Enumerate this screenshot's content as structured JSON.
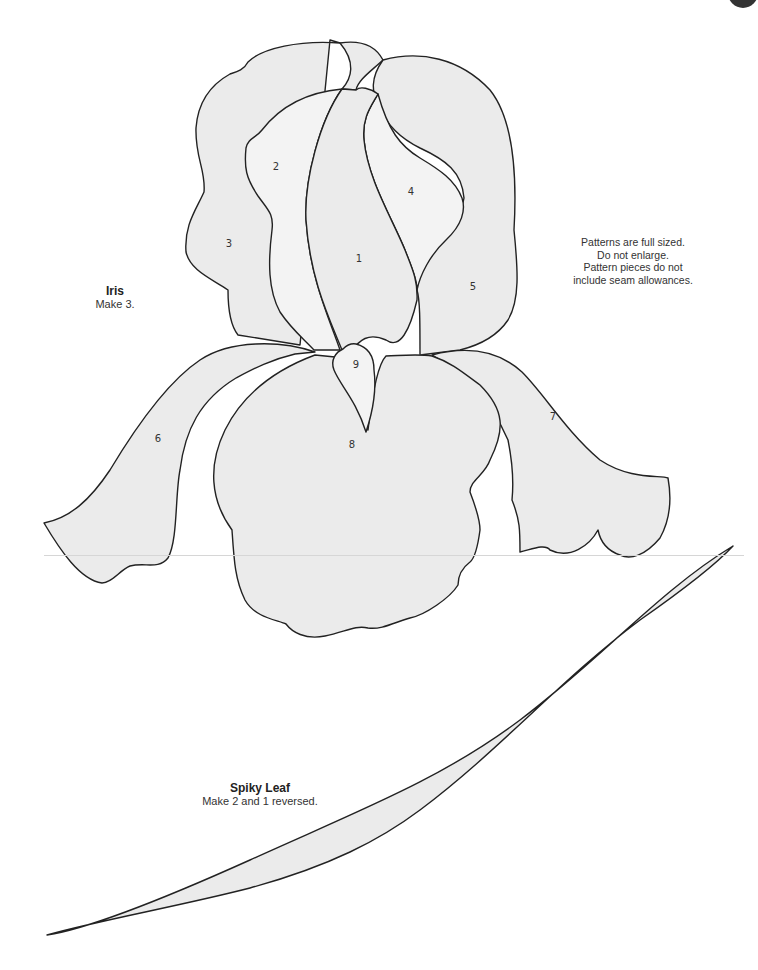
{
  "page": {
    "note": {
      "lines": [
        "Patterns are full sized.",
        "Do not enlarge.",
        "Pattern pieces do not",
        "include seam allowances."
      ]
    },
    "iris": {
      "title": "Iris",
      "instruction": "Make 3.",
      "piece_numbers": [
        "1",
        "2",
        "3",
        "4",
        "5",
        "6",
        "7",
        "8",
        "9"
      ]
    },
    "spiky_leaf": {
      "title": "Spiky Leaf",
      "instruction": "Make 2 and 1 reversed."
    },
    "colors": {
      "piece_fill": "#ebebeb",
      "outline": "#222222",
      "text": "#333333"
    }
  }
}
